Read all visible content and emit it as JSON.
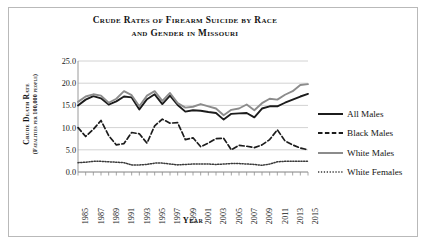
{
  "chart_data": {
    "type": "line",
    "title": "Crude Rates of Firearm Suicide by Race and Gender in Missouri",
    "title_line1": "Crude Rates of Firearm Suicide by Race",
    "title_line2": "and Gender in Missouri",
    "xlabel": "Year",
    "ylabel": "Crude Death Rate",
    "ylabel_sub": "(Fatalities per 100,000 people)",
    "ylim": [
      0.0,
      25.0
    ],
    "yticks": [
      0.0,
      5.0,
      10.0,
      15.0,
      20.0,
      25.0
    ],
    "ytick_labels": [
      "0.0",
      "5.0",
      "10.0",
      "15.0",
      "20.0",
      "25.0"
    ],
    "grid": "horizontal",
    "legend_position": "right",
    "x": [
      1985,
      1986,
      1987,
      1988,
      1989,
      1990,
      1991,
      1992,
      1993,
      1994,
      1995,
      1996,
      1997,
      1998,
      1999,
      2000,
      2001,
      2002,
      2003,
      2004,
      2005,
      2006,
      2007,
      2008,
      2009,
      2010,
      2011,
      2012,
      2013,
      2014,
      2015
    ],
    "xtick_labels": [
      "1985",
      "1986",
      "1987",
      "1988",
      "1989",
      "1990",
      "1991",
      "1992",
      "1993",
      "1994",
      "1995",
      "1996",
      "1997",
      "1998",
      "1999",
      "2000",
      "2001",
      "2002",
      "2003",
      "2004",
      "2005",
      "2006",
      "2007",
      "2008",
      "2009",
      "2010",
      "2011",
      "2012",
      "2013",
      "2014",
      "2015"
    ],
    "xtick_labels_shown": [
      "1985",
      "1987",
      "1989",
      "1991",
      "1993",
      "1995",
      "1997",
      "1999",
      "2001",
      "2003",
      "2005",
      "2007",
      "2009",
      "2011",
      "2013",
      "2015"
    ],
    "series": [
      {
        "name": "All Males",
        "style": "solid",
        "color": "#1c1c1c",
        "width": 1.9,
        "values": [
          15.0,
          16.3,
          17.1,
          16.6,
          15.2,
          15.9,
          17.0,
          16.8,
          14.1,
          16.4,
          17.5,
          15.3,
          17.2,
          15.1,
          13.6,
          13.9,
          13.8,
          13.5,
          13.3,
          11.8,
          13.1,
          13.2,
          13.3,
          12.3,
          14.3,
          14.8,
          14.8,
          15.6,
          16.3,
          17.0,
          17.6
        ]
      },
      {
        "name": "Black Males",
        "style": "dashed",
        "color": "#1c1c1c",
        "width": 1.7,
        "values": [
          10.0,
          8.0,
          9.6,
          11.6,
          8.2,
          6.1,
          6.4,
          8.9,
          8.6,
          6.5,
          10.4,
          11.9,
          11.0,
          11.1,
          7.3,
          7.7,
          5.7,
          6.5,
          7.5,
          7.6,
          5.0,
          6.0,
          5.8,
          5.5,
          6.1,
          7.3,
          9.5,
          7.0,
          6.1,
          5.4,
          5.0
        ]
      },
      {
        "name": "White Males",
        "style": "solid",
        "color": "#8c8c8c",
        "width": 1.9,
        "values": [
          15.8,
          17.0,
          17.5,
          17.2,
          15.6,
          16.5,
          18.2,
          17.3,
          14.8,
          17.2,
          18.2,
          16.0,
          17.8,
          15.5,
          14.5,
          14.7,
          15.3,
          14.8,
          14.3,
          12.8,
          14.0,
          14.3,
          15.2,
          13.9,
          15.5,
          16.5,
          16.3,
          17.4,
          18.2,
          19.6,
          19.8
        ]
      },
      {
        "name": "White Females",
        "style": "dotted",
        "color": "#3a3a3a",
        "width": 1.5,
        "values": [
          2.1,
          2.2,
          2.4,
          2.4,
          2.3,
          2.2,
          2.1,
          1.6,
          1.6,
          1.7,
          2.0,
          2.0,
          1.8,
          1.6,
          1.7,
          1.8,
          1.8,
          1.8,
          1.7,
          1.8,
          1.9,
          1.9,
          1.8,
          1.7,
          1.5,
          1.8,
          2.3,
          2.4,
          2.4,
          2.4,
          2.4
        ]
      }
    ]
  },
  "legend": {
    "items": [
      {
        "label": "All Males"
      },
      {
        "label": "Black Males"
      },
      {
        "label": "White Males"
      },
      {
        "label": "White Females"
      }
    ]
  }
}
